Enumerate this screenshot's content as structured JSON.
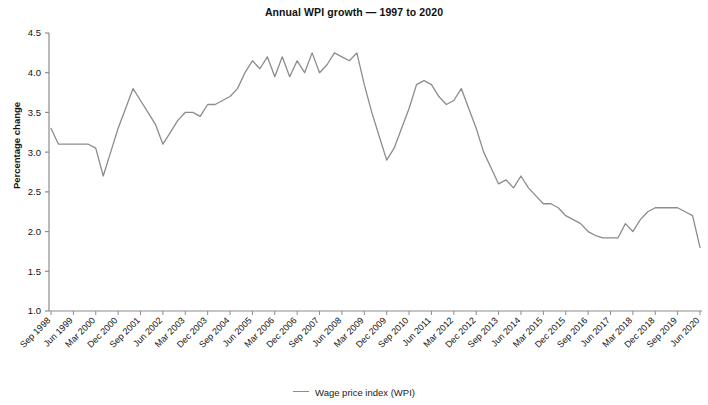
{
  "chart_data": {
    "type": "line",
    "title": "Annual WPI growth — 1997 to 2020",
    "xlabel": "",
    "ylabel": "Percentage change",
    "ylim": [
      1.0,
      4.5
    ],
    "yticks": [
      "1.0",
      "1.5",
      "2.0",
      "2.5",
      "3.0",
      "3.5",
      "4.0",
      "4.5"
    ],
    "grid": false,
    "legend_position": "bottom-center",
    "legend": [
      "Wage price index (WPI)"
    ],
    "line_color": "#8c8c8c",
    "categories": [
      "Sep 1998",
      "Dec 1998",
      "Mar 1999",
      "Jun 1999",
      "Sep 1999",
      "Dec 1999",
      "Mar 2000",
      "Jun 2000",
      "Sep 2000",
      "Dec 2000",
      "Mar 2001",
      "Jun 2001",
      "Sep 2001",
      "Dec 2001",
      "Mar 2002",
      "Jun 2002",
      "Sep 2002",
      "Dec 2002",
      "Mar 2003",
      "Jun 2003",
      "Sep 2003",
      "Dec 2003",
      "Mar 2004",
      "Jun 2004",
      "Sep 2004",
      "Dec 2004",
      "Mar 2005",
      "Jun 2005",
      "Sep 2005",
      "Dec 2005",
      "Mar 2006",
      "Jun 2006",
      "Sep 2006",
      "Dec 2006",
      "Mar 2007",
      "Jun 2007",
      "Sep 2007",
      "Dec 2007",
      "Mar 2008",
      "Jun 2008",
      "Sep 2008",
      "Dec 2008",
      "Mar 2009",
      "Jun 2009",
      "Sep 2009",
      "Dec 2009",
      "Mar 2010",
      "Jun 2010",
      "Sep 2010",
      "Dec 2010",
      "Mar 2011",
      "Jun 2011",
      "Sep 2011",
      "Dec 2011",
      "Mar 2012",
      "Jun 2012",
      "Sep 2012",
      "Dec 2012",
      "Mar 2013",
      "Jun 2013",
      "Sep 2013",
      "Dec 2013",
      "Mar 2014",
      "Jun 2014",
      "Sep 2014",
      "Dec 2014",
      "Mar 2015",
      "Jun 2015",
      "Sep 2015",
      "Dec 2015",
      "Mar 2016",
      "Jun 2016",
      "Sep 2016",
      "Dec 2016",
      "Mar 2017",
      "Jun 2017",
      "Sep 2017",
      "Dec 2017",
      "Mar 2018",
      "Jun 2018",
      "Sep 2018",
      "Dec 2018",
      "Mar 2019",
      "Jun 2019",
      "Sep 2019",
      "Dec 2019",
      "Mar 2020",
      "Jun 2020"
    ],
    "xtick_labels": [
      "Sep 1998",
      "Jun 1999",
      "Mar 2000",
      "Dec 2000",
      "Sep 2001",
      "Jun 2002",
      "Mar 2003",
      "Dec 2003",
      "Sep 2004",
      "Jun 2005",
      "Mar 2006",
      "Dec 2006",
      "Sep 2007",
      "Jun 2008",
      "Mar 2009",
      "Dec 2009",
      "Sep 2010",
      "Jun 2011",
      "Mar 2012",
      "Dec 2012",
      "Sep 2013",
      "Jun 2014",
      "Mar 2015",
      "Dec 2015",
      "Sep 2016",
      "Jun 2017",
      "Mar 2018",
      "Dec 2018",
      "Sep 2019",
      "Jun 2020"
    ],
    "xtick_every": 3,
    "series": [
      {
        "name": "Wage price index (WPI)",
        "values": [
          3.3,
          3.1,
          3.1,
          3.1,
          3.1,
          3.1,
          3.05,
          2.7,
          3.0,
          3.3,
          3.55,
          3.8,
          3.65,
          3.5,
          3.35,
          3.1,
          3.25,
          3.4,
          3.5,
          3.5,
          3.45,
          3.6,
          3.6,
          3.65,
          3.7,
          3.8,
          4.0,
          4.15,
          4.05,
          4.2,
          3.95,
          4.2,
          3.95,
          4.15,
          4.0,
          4.25,
          4.0,
          4.1,
          4.25,
          4.2,
          4.15,
          4.25,
          3.85,
          3.5,
          3.2,
          2.9,
          3.05,
          3.3,
          3.55,
          3.85,
          3.9,
          3.85,
          3.7,
          3.6,
          3.65,
          3.8,
          3.55,
          3.3,
          3.0,
          2.8,
          2.6,
          2.65,
          2.55,
          2.7,
          2.55,
          2.45,
          2.35,
          2.35,
          2.3,
          2.2,
          2.15,
          2.1,
          2.0,
          1.95,
          1.92,
          1.92,
          1.92,
          2.1,
          2.0,
          2.15,
          2.25,
          2.3,
          2.3,
          2.3,
          2.3,
          2.25,
          2.2,
          1.8
        ]
      }
    ]
  },
  "legend": {
    "label": "Wage price index (WPI)"
  },
  "axis": {
    "y_title": "Percentage change"
  }
}
